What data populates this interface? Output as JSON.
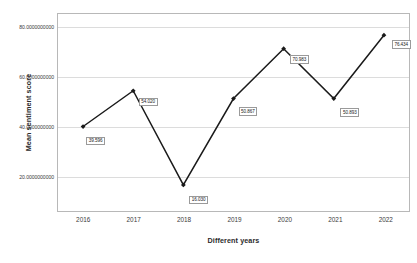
{
  "chart_data": {
    "type": "line",
    "title": "",
    "xlabel": "Different years",
    "ylabel": "Mean sentiment score",
    "categories": [
      "2016",
      "2017",
      "2018",
      "2019",
      "2020",
      "2021",
      "2022"
    ],
    "values": [
      39.596,
      54.02,
      16.03,
      50.867,
      70.983,
      50.893,
      76.434
    ],
    "point_labels": [
      "39.596",
      "54.020",
      "16.030",
      "50.867",
      "70.983",
      "50.893",
      "76.434"
    ],
    "ylim": [
      5.5,
      85.0
    ],
    "yticks": [
      20,
      40,
      60,
      80
    ],
    "ytick_labels": [
      "80.0000000000",
      "60.0000000000",
      "40.0000000000",
      "20.0000000000"
    ],
    "grid": "horizontal",
    "legend": "none",
    "series_color": "#1a1a1a",
    "marker": "diamond",
    "gridline_color": "#dcdcdc",
    "axis_border_color": "#b8b8b8",
    "label_box_border_color": "#9a9a9a",
    "background_color": "#ffffff"
  },
  "axes": {
    "y_title": "Mean sentiment score",
    "x_title": "Different years"
  }
}
